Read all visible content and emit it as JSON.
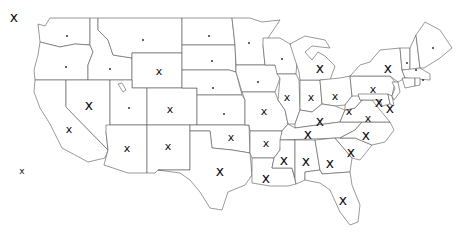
{
  "map": {
    "title": "United States state map with markers",
    "marker_glyph": "x",
    "colors": {
      "background": "#ffffff",
      "border": "#555555",
      "marker": "#111111"
    },
    "markers": [
      {
        "state": "AK",
        "type": "x",
        "size": "lg",
        "x": 14,
        "y": 17
      },
      {
        "state": "HI",
        "type": "x",
        "size": "sm",
        "x": 22,
        "y": 171
      },
      {
        "state": "WA",
        "type": "dot",
        "x": 67,
        "y": 36
      },
      {
        "state": "OR",
        "type": "dot",
        "x": 66,
        "y": 67
      },
      {
        "state": "ID",
        "type": "dot",
        "x": 110,
        "y": 69
      },
      {
        "state": "MT",
        "type": "dot",
        "x": 143,
        "y": 40
      },
      {
        "state": "WY",
        "type": "x",
        "size": "md",
        "x": 159,
        "y": 71
      },
      {
        "state": "NV",
        "type": "x",
        "size": "lg",
        "x": 89,
        "y": 105
      },
      {
        "state": "UT",
        "type": "dot",
        "x": 129,
        "y": 108
      },
      {
        "state": "CO",
        "type": "x",
        "size": "md",
        "x": 170,
        "y": 109
      },
      {
        "state": "CA",
        "type": "x",
        "size": "md",
        "x": 69,
        "y": 129
      },
      {
        "state": "AZ",
        "type": "x",
        "size": "md",
        "x": 127,
        "y": 148
      },
      {
        "state": "NM",
        "type": "x",
        "size": "md",
        "x": 168,
        "y": 146
      },
      {
        "state": "ND",
        "type": "dot",
        "x": 209,
        "y": 36
      },
      {
        "state": "SD",
        "type": "dot",
        "x": 212,
        "y": 61
      },
      {
        "state": "NE",
        "type": "dot",
        "x": 213,
        "y": 88
      },
      {
        "state": "KS",
        "type": "dot",
        "x": 224,
        "y": 114
      },
      {
        "state": "OK",
        "type": "x",
        "size": "md",
        "x": 231,
        "y": 137
      },
      {
        "state": "TX",
        "type": "x",
        "size": "lg",
        "x": 220,
        "y": 171
      },
      {
        "state": "MN",
        "type": "dot",
        "x": 249,
        "y": 43
      },
      {
        "state": "IA",
        "type": "dot",
        "x": 258,
        "y": 82
      },
      {
        "state": "WI",
        "type": "dot",
        "x": 282,
        "y": 59
      },
      {
        "state": "MO",
        "type": "x",
        "size": "md",
        "x": 264,
        "y": 111
      },
      {
        "state": "AR",
        "type": "x",
        "size": "md",
        "x": 266,
        "y": 143
      },
      {
        "state": "LA",
        "type": "x",
        "size": "lg",
        "x": 266,
        "y": 178
      },
      {
        "state": "MS",
        "type": "x",
        "size": "lg",
        "x": 284,
        "y": 160
      },
      {
        "state": "IL",
        "type": "x",
        "size": "md",
        "x": 287,
        "y": 97
      },
      {
        "state": "IN",
        "type": "x",
        "size": "md",
        "x": 311,
        "y": 97
      },
      {
        "state": "OH",
        "type": "x",
        "size": "md",
        "x": 335,
        "y": 96
      },
      {
        "state": "MI",
        "type": "x",
        "size": "lg",
        "x": 320,
        "y": 68
      },
      {
        "state": "KY",
        "type": "x",
        "size": "lg",
        "x": 320,
        "y": 121
      },
      {
        "state": "TN",
        "type": "x",
        "size": "lg",
        "x": 308,
        "y": 134
      },
      {
        "state": "AL",
        "type": "x",
        "size": "lg",
        "x": 306,
        "y": 161
      },
      {
        "state": "GA",
        "type": "x",
        "size": "lg",
        "x": 330,
        "y": 163
      },
      {
        "state": "SC",
        "type": "x",
        "size": "lg",
        "x": 351,
        "y": 152
      },
      {
        "state": "NC",
        "type": "x",
        "size": "lg",
        "x": 366,
        "y": 135
      },
      {
        "state": "VA",
        "type": "x",
        "size": "md",
        "x": 368,
        "y": 118
      },
      {
        "state": "WV",
        "type": "x",
        "size": "md",
        "x": 349,
        "y": 111
      },
      {
        "state": "PA",
        "type": "x",
        "size": "md",
        "x": 373,
        "y": 89
      },
      {
        "state": "NY",
        "type": "x",
        "size": "lg",
        "x": 388,
        "y": 68
      },
      {
        "state": "MD",
        "type": "x",
        "size": "lg",
        "x": 379,
        "y": 102
      },
      {
        "state": "DE",
        "type": "x",
        "size": "lg",
        "x": 390,
        "y": 108
      },
      {
        "state": "FL",
        "type": "x",
        "size": "lg",
        "x": 343,
        "y": 200
      },
      {
        "state": "ME",
        "type": "dot",
        "x": 433,
        "y": 48
      },
      {
        "state": "VT",
        "type": "dot",
        "x": 407,
        "y": 63
      },
      {
        "state": "NH",
        "type": "dot",
        "x": 416,
        "y": 70
      },
      {
        "state": "MA",
        "type": "dot",
        "x": 423,
        "y": 80
      }
    ]
  },
  "caption": {
    "text": ""
  }
}
